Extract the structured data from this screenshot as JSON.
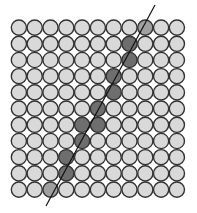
{
  "diagram": {
    "type": "pixel-grid-line-rasterization",
    "rows": 11,
    "cols": 11,
    "origin": [
      11,
      19.5
    ],
    "cell_w": 15.8,
    "cell_h": 16.2,
    "radius": 7.6,
    "colors": {
      "background": "#ffffff",
      "cell_fill": "#d9d9d9",
      "cell_stroke": "#333333",
      "dark_fill": "#6e6e6e",
      "light_fill": "#a0a0a0",
      "line": "#111111"
    },
    "shaded_cells": [
      {
        "row": 0,
        "col": 8,
        "shade": "light"
      },
      {
        "row": 1,
        "col": 7,
        "shade": "dark"
      },
      {
        "row": 2,
        "col": 7,
        "shade": "dark"
      },
      {
        "row": 3,
        "col": 6,
        "shade": "dark"
      },
      {
        "row": 4,
        "col": 6,
        "shade": "dark"
      },
      {
        "row": 5,
        "col": 5,
        "shade": "dark"
      },
      {
        "row": 6,
        "col": 4,
        "shade": "dark"
      },
      {
        "row": 6,
        "col": 5,
        "shade": "dark"
      },
      {
        "row": 7,
        "col": 4,
        "shade": "dark"
      },
      {
        "row": 8,
        "col": 3,
        "shade": "dark"
      },
      {
        "row": 9,
        "col": 3,
        "shade": "dark"
      },
      {
        "row": 10,
        "col": 2,
        "shade": "light"
      }
    ],
    "line": {
      "x1": 46,
      "y1": 206,
      "x2": 155,
      "y2": 5
    }
  }
}
